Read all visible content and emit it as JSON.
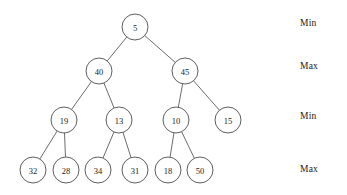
{
  "diagram": {
    "type": "min-max-heap-binary-tree",
    "node_radius": 13,
    "nodes": [
      {
        "id": "n5",
        "value": "5",
        "cx": 135,
        "cy": 27,
        "level": 0
      },
      {
        "id": "n40",
        "value": "40",
        "cx": 99,
        "cy": 71,
        "level": 1
      },
      {
        "id": "n45",
        "value": "45",
        "cx": 185,
        "cy": 71,
        "level": 1
      },
      {
        "id": "n19",
        "value": "19",
        "cx": 64,
        "cy": 120,
        "level": 2
      },
      {
        "id": "n13",
        "value": "13",
        "cx": 119,
        "cy": 120,
        "level": 2
      },
      {
        "id": "n10",
        "value": "10",
        "cx": 176,
        "cy": 120,
        "level": 2
      },
      {
        "id": "n15",
        "value": "15",
        "cx": 228,
        "cy": 120,
        "level": 2
      },
      {
        "id": "n32",
        "value": "32",
        "cx": 33,
        "cy": 170,
        "level": 3
      },
      {
        "id": "n28",
        "value": "28",
        "cx": 66,
        "cy": 170,
        "level": 3
      },
      {
        "id": "n34",
        "value": "34",
        "cx": 98,
        "cy": 170,
        "level": 3
      },
      {
        "id": "n31",
        "value": "31",
        "cx": 135,
        "cy": 170,
        "level": 3
      },
      {
        "id": "n18",
        "value": "18",
        "cx": 168,
        "cy": 170,
        "level": 3
      },
      {
        "id": "n50",
        "value": "50",
        "cx": 200,
        "cy": 170,
        "level": 3
      }
    ],
    "edges": [
      {
        "from": "n5",
        "to": "n40"
      },
      {
        "from": "n5",
        "to": "n45"
      },
      {
        "from": "n40",
        "to": "n19"
      },
      {
        "from": "n40",
        "to": "n13"
      },
      {
        "from": "n45",
        "to": "n10"
      },
      {
        "from": "n45",
        "to": "n15"
      },
      {
        "from": "n19",
        "to": "n32"
      },
      {
        "from": "n19",
        "to": "n28"
      },
      {
        "from": "n13",
        "to": "n34"
      },
      {
        "from": "n13",
        "to": "n31"
      },
      {
        "from": "n10",
        "to": "n18"
      },
      {
        "from": "n10",
        "to": "n50"
      }
    ],
    "level_labels": [
      {
        "id": "lvl0",
        "text": "Min",
        "x": 300,
        "y": 18
      },
      {
        "id": "lvl1",
        "text": "Max",
        "x": 300,
        "y": 61
      },
      {
        "id": "lvl2",
        "text": "Min",
        "x": 300,
        "y": 111
      },
      {
        "id": "lvl3",
        "text": "Max",
        "x": 300,
        "y": 164
      }
    ],
    "colors": {
      "background": "#ffffff",
      "node_stroke": "#4d4d4d",
      "node_fill": "#ffffff",
      "edge_stroke": "#5a5a5a",
      "text": "#1a1a1a"
    }
  }
}
